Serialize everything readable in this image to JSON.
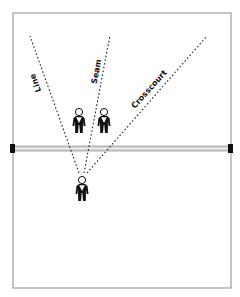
{
  "diagram": {
    "type": "volleyball-attack-zones",
    "court": {
      "x": 13,
      "y": 13,
      "width": 218,
      "height": 275,
      "stroke": "#8a8a8a"
    },
    "net": {
      "y": 148,
      "color": "#c8c8c8",
      "post_color": "#111111"
    },
    "hitter": {
      "x": 82,
      "y": 180
    },
    "blockers": [
      {
        "x": 79,
        "y": 121
      },
      {
        "x": 104,
        "y": 121
      }
    ],
    "attack_lines": [
      {
        "label": "Line",
        "from": [
          82,
          173
        ],
        "to": [
          30,
          36
        ],
        "label_pos": [
          40,
          70
        ],
        "label_angle": 70
      },
      {
        "label": "Seam",
        "from": [
          84,
          173
        ],
        "to": [
          110,
          35
        ],
        "label_pos": [
          96,
          65
        ],
        "label_angle": -79
      },
      {
        "label": "Crosscourt",
        "from": [
          86,
          173
        ],
        "to": [
          207,
          36
        ],
        "label_pos": [
          150,
          93
        ],
        "label_angle": -48
      }
    ]
  },
  "labels": {
    "line": "Line",
    "seam": "Seam",
    "crosscourt": "Crosscourt"
  }
}
